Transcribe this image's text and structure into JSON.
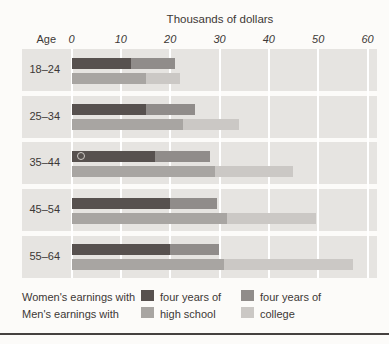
{
  "figure": {
    "title": "Thousands of dollars",
    "age_axis_label": "Age"
  },
  "chart_data": {
    "type": "bar",
    "orientation": "horizontal",
    "title": "Thousands of dollars",
    "x_axis": {
      "label": "Thousands of dollars",
      "min": 0,
      "max": 60,
      "ticks": [
        0,
        10,
        20,
        30,
        40,
        50,
        60
      ]
    },
    "y_axis": {
      "label": "Age"
    },
    "categories": [
      "18–24",
      "25–34",
      "35–44",
      "45–54",
      "55–64"
    ],
    "series": [
      {
        "name": "Women's earnings with four years of high school",
        "key": "women-high-school",
        "color": "#57514f",
        "values": [
          12,
          15,
          17,
          20,
          20
        ]
      },
      {
        "name": "Women's earnings with four years of college",
        "key": "women-college",
        "color": "#908c8a",
        "values": [
          21,
          25,
          28,
          29.5,
          30
        ]
      },
      {
        "name": "Men's earnings with four years of high school",
        "key": "men-high-school",
        "color": "#a8a5a2",
        "values": [
          15,
          22.5,
          29,
          31.5,
          31
        ]
      },
      {
        "name": "Men's earnings with four years of college",
        "key": "men-college",
        "color": "#cbc8c5",
        "values": [
          22,
          34,
          45,
          49.5,
          57
        ]
      }
    ],
    "bar_style": "Each age group has two bars (women on top, men below); the darker left portion marks earnings with four years of high school and the lighter extension of the same bar marks earnings with four years of college.",
    "legend_position": "bottom",
    "grid": true,
    "gridline_color": "#ffffff",
    "band_background": "#e6e4e1"
  },
  "legend": {
    "rows": [
      {
        "label": "Women's earnings with"
      },
      {
        "label": "Men's earnings with"
      }
    ],
    "columns": [
      {
        "line1": "four years of",
        "line2": "high school"
      },
      {
        "line1": "four years of",
        "line2": "college"
      }
    ]
  },
  "colors": {
    "page_bg": "#fcfbf9",
    "band_bg": "#e6e4e1",
    "gridline": "#ffffff",
    "text": "#3c3836",
    "women_high_school": "#57514f",
    "women_college": "#908c8a",
    "men_high_school": "#a8a5a2",
    "men_college": "#cbc8c5",
    "bottom_rule": "#454140"
  }
}
